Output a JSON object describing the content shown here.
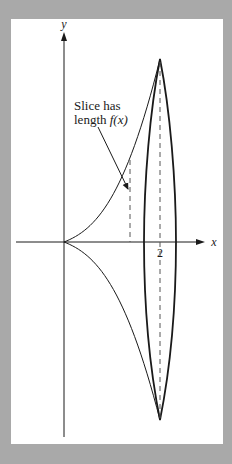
{
  "figure": {
    "axes": {
      "x_label": "x",
      "y_label": "y",
      "x_tick_label": "2"
    },
    "annotation": {
      "line1": "Slice has",
      "line2_prefix": "length ",
      "line2_math": "f(x)"
    },
    "colors": {
      "background": "#a9a9a9",
      "panel": "#ffffff",
      "ink": "#1a1a1a",
      "dashed": "#555555"
    }
  }
}
